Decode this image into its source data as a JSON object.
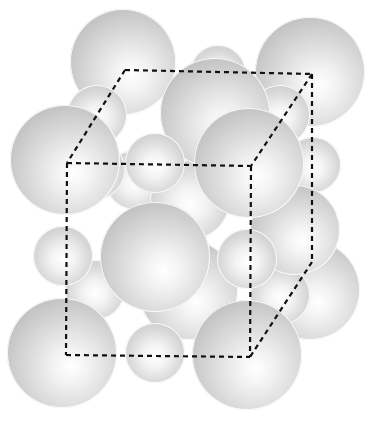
{
  "diagram": {
    "type": "crystal-lattice-unit-cell",
    "colors": {
      "sphere_light": "#ffffff",
      "sphere_dark": "#b3b3b3",
      "cell_line": "#111111",
      "background": "#ffffff"
    },
    "cell": {
      "back": {
        "tl": [
          125,
          70
        ],
        "tr": [
          312,
          74
        ],
        "br": [
          312,
          262
        ]
      },
      "front": {
        "tl": [
          67,
          163
        ],
        "tr": [
          251,
          166
        ],
        "bl": [
          66,
          355
        ],
        "br": [
          250,
          357
        ]
      }
    },
    "spheres": [
      {
        "cx": 123,
        "cy": 62,
        "r": 53,
        "size": "large"
      },
      {
        "cx": 218,
        "cy": 73,
        "r": 28,
        "size": "small"
      },
      {
        "cx": 310,
        "cy": 72,
        "r": 55,
        "size": "large"
      },
      {
        "cx": 310,
        "cy": 290,
        "r": 50,
        "size": "large"
      },
      {
        "cx": 97,
        "cy": 115,
        "r": 30,
        "size": "small"
      },
      {
        "cx": 280,
        "cy": 115,
        "r": 30,
        "size": "small"
      },
      {
        "cx": 313,
        "cy": 165,
        "r": 28,
        "size": "small"
      },
      {
        "cx": 135,
        "cy": 180,
        "r": 30,
        "size": "small"
      },
      {
        "cx": 190,
        "cy": 200,
        "r": 40,
        "size": "small"
      },
      {
        "cx": 188,
        "cy": 290,
        "r": 50,
        "size": "large"
      },
      {
        "cx": 95,
        "cy": 290,
        "r": 30,
        "size": "small"
      },
      {
        "cx": 280,
        "cy": 295,
        "r": 30,
        "size": "small"
      },
      {
        "cx": 295,
        "cy": 230,
        "r": 45,
        "size": "large"
      },
      {
        "cx": 95,
        "cy": 170,
        "r": 30,
        "size": "small"
      },
      {
        "cx": 215,
        "cy": 113,
        "r": 55,
        "size": "large"
      },
      {
        "cx": 65,
        "cy": 160,
        "r": 55,
        "size": "large"
      },
      {
        "cx": 249,
        "cy": 163,
        "r": 55,
        "size": "large"
      },
      {
        "cx": 155,
        "cy": 163,
        "r": 30,
        "size": "small"
      },
      {
        "cx": 63,
        "cy": 256,
        "r": 30,
        "size": "small"
      },
      {
        "cx": 155,
        "cy": 257,
        "r": 55,
        "size": "large"
      },
      {
        "cx": 247,
        "cy": 259,
        "r": 30,
        "size": "small"
      },
      {
        "cx": 62,
        "cy": 353,
        "r": 55,
        "size": "large"
      },
      {
        "cx": 155,
        "cy": 353,
        "r": 30,
        "size": "small"
      },
      {
        "cx": 247,
        "cy": 355,
        "r": 55,
        "size": "large"
      }
    ]
  }
}
